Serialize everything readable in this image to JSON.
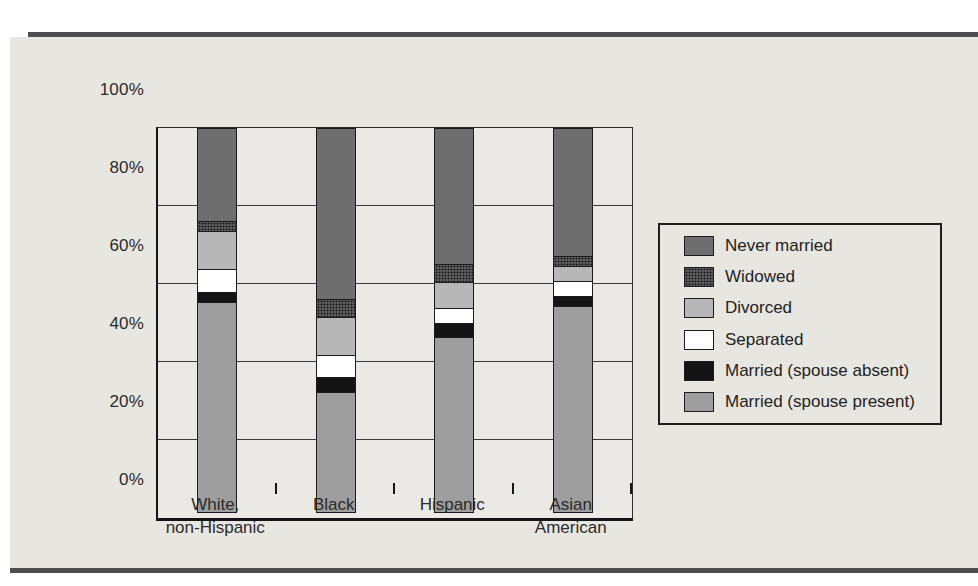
{
  "figure": {
    "panel_background": "#e8e6e1",
    "rule_color": "#4e4e4e",
    "plot_background": "#ebe9e5"
  },
  "chart_data": {
    "type": "bar",
    "stacked": true,
    "percent_total": 100,
    "title": "",
    "xlabel": "",
    "ylabel": "",
    "ylim": [
      0,
      100
    ],
    "grid": true,
    "legend_position": "right",
    "y_ticks": [
      {
        "label": "0%",
        "value": 0
      },
      {
        "label": "20%",
        "value": 20
      },
      {
        "label": "40%",
        "value": 40
      },
      {
        "label": "60%",
        "value": 60
      },
      {
        "label": "80%",
        "value": 80
      },
      {
        "label": "100%",
        "value": 100
      }
    ],
    "categories": [
      {
        "label": "White,\nnon-Hispanic"
      },
      {
        "label": "Black"
      },
      {
        "label": "Hispanic"
      },
      {
        "label": "Asian\nAmerican"
      }
    ],
    "series_bottom_to_top": [
      {
        "name": "Married (spouse present)",
        "key": "married-spouse-present",
        "color": "#9e9e9e",
        "pattern": "none",
        "values": [
          54,
          31,
          45,
          53
        ]
      },
      {
        "name": "Married (spouse absent)",
        "key": "married-spouse-absent",
        "color": "#141414",
        "pattern": "none",
        "values": [
          3,
          4,
          4,
          3
        ]
      },
      {
        "name": "Separated",
        "key": "separated",
        "color": "#ffffff",
        "pattern": "none",
        "values": [
          6,
          6,
          4,
          4
        ]
      },
      {
        "name": "Divorced",
        "key": "divorced",
        "color": "#b7b7b7",
        "pattern": "none",
        "values": [
          10,
          10,
          7,
          4
        ]
      },
      {
        "name": "Widowed",
        "key": "widowed",
        "color": "#5a5a5a",
        "pattern": "dots",
        "values": [
          3,
          5,
          5,
          3
        ]
      },
      {
        "name": "Never married",
        "key": "never-married",
        "color": "#6e6e6e",
        "pattern": "none",
        "values": [
          24,
          44,
          35,
          33
        ]
      }
    ]
  }
}
